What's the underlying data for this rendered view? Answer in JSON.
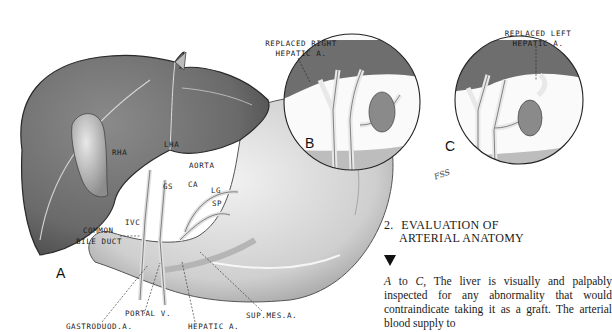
{
  "figure": {
    "panels": [
      {
        "letter": "A",
        "labels": [
          "RHA",
          "LHA",
          "AORTA",
          "GS",
          "CA",
          "LG",
          "SP",
          "IVC",
          "COMMON",
          "BILE DUCT",
          "PORTAL V.",
          "GASTRODUOD.A.",
          "HEPATIC A.",
          "SUP.MES.A."
        ]
      },
      {
        "letter": "B",
        "labels": [
          "REPLACED RIGHT",
          "HEPATIC A."
        ]
      },
      {
        "letter": "C",
        "labels": [
          "REPLACED LEFT",
          "HEPATIC A."
        ]
      }
    ],
    "artist_signature": "FSS"
  },
  "caption": {
    "number": "2.",
    "heading_line1": "EVALUATION OF",
    "heading_line2": "ARTERIAL ANATOMY",
    "body_italic_start": "A",
    "body_to": " to ",
    "body_italic_end": "C,",
    "body_text": " The liver is visually and palpably inspected for any abnormality that would contraindicate taking it as a graft. The arterial blood supply to"
  }
}
